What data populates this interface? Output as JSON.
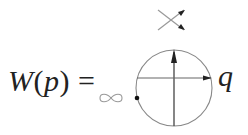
{
  "formula": {
    "function_name": "W",
    "open_paren": "(",
    "argument": "p",
    "close_paren": ")",
    "equals": "="
  },
  "diagram": {
    "infinity_symbol": "∞",
    "axis_label": "q",
    "crossing_description": "oriented crossing with two arrows pointing right",
    "circle_description": "circle with vertical upward arrow and horizontal rightward arrow, dot on left boundary",
    "colors": {
      "line": "#888888",
      "arrow": "#222222",
      "dot": "#111111"
    }
  }
}
